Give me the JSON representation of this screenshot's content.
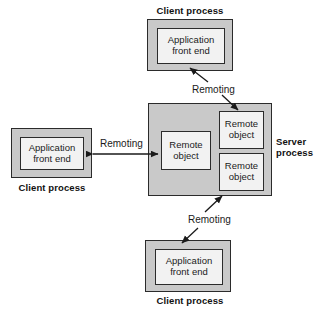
{
  "diagram": {
    "colors": {
      "process_fill": "#c9c9c9",
      "component_fill": "#f2f2f2",
      "stroke": "#2b2b2b",
      "text": "#1a1a1a",
      "background": "#ffffff"
    },
    "labels": {
      "client_process": "Client process",
      "server_process": "Server process",
      "application_front_end": "Application\nfront end",
      "remote_object": "Remote\nobject",
      "remoting": "Remoting"
    },
    "nodes": [
      {
        "id": "client-top",
        "type": "process",
        "caption": "Client process",
        "caption_position": "above",
        "component": "Application\nfront end"
      },
      {
        "id": "client-left",
        "type": "process",
        "caption": "Client process",
        "caption_position": "below",
        "component": "Application\nfront end"
      },
      {
        "id": "client-bottom",
        "type": "process",
        "caption": "Client process",
        "caption_position": "below",
        "component": "Application\nfront end"
      },
      {
        "id": "server",
        "type": "process",
        "caption": "Server\nprocess",
        "caption_position": "right",
        "components": [
          {
            "id": "remote-object-center",
            "label": "Remote\nobject"
          },
          {
            "id": "remote-object-top-right",
            "label": "Remote\nobject"
          },
          {
            "id": "remote-object-bottom-right",
            "label": "Remote\nobject"
          }
        ]
      }
    ],
    "connections": [
      {
        "id": "remoting-top",
        "label": "Remoting",
        "from": "client-top",
        "to": "remote-object-top-right",
        "arrowheads": "both-ends-separate-segments"
      },
      {
        "id": "remoting-left",
        "label": "Remoting",
        "from": "client-left",
        "to": "remote-object-center",
        "arrowheads": "double"
      },
      {
        "id": "remoting-bottom",
        "label": "Remoting",
        "from": "client-bottom",
        "to": "remote-object-bottom-right",
        "arrowheads": "both-ends-separate-segments"
      }
    ]
  }
}
